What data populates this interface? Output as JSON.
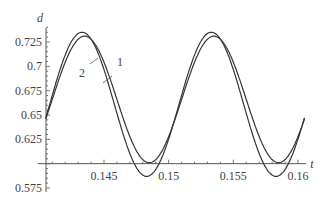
{
  "chart_data": {
    "type": "line",
    "title": "",
    "xlabel": "t",
    "ylabel": "d",
    "xlim": [
      0.1405,
      0.1605
    ],
    "ylim": [
      0.57,
      0.745
    ],
    "x_axis_crosses_at": 0.6,
    "x_ticks": [
      "0.145",
      "0.15",
      "0.155",
      "0.16"
    ],
    "y_ticks": [
      "0.575",
      "0.625",
      "0.65",
      "0.675",
      "0.7",
      "0.725"
    ],
    "grid": false,
    "legend": "inline annotations",
    "annotations": [
      {
        "text": "1",
        "points_to": "series 1 (outer curve)",
        "near": [
          0.1485,
          0.726
        ]
      },
      {
        "text": "2",
        "points_to": "series 2 (inner curve)",
        "near": [
          0.145,
          0.703
        ]
      }
    ],
    "series": [
      {
        "name": "1",
        "description": "larger amplitude oscillation",
        "x": [
          0.1405,
          0.1433,
          0.1485,
          0.1533,
          0.1585,
          0.1605
        ],
        "y": [
          0.605,
          0.735,
          0.587,
          0.735,
          0.587,
          0.615
        ]
      },
      {
        "name": "2",
        "description": "smaller amplitude oscillation",
        "x": [
          0.1405,
          0.1435,
          0.1483,
          0.1535,
          0.1583,
          0.1605
        ],
        "y": [
          0.622,
          0.731,
          0.601,
          0.731,
          0.601,
          0.628
        ]
      }
    ]
  }
}
